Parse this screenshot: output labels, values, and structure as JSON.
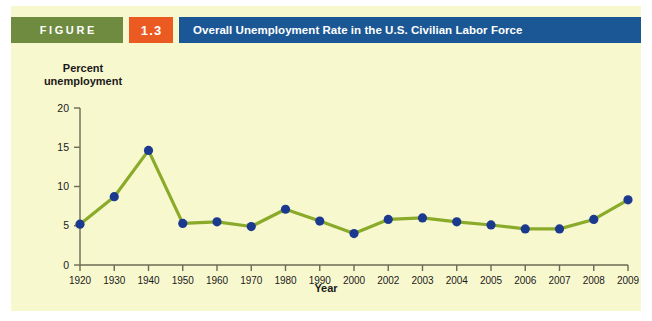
{
  "header": {
    "figure_label": "FIGURE",
    "figure_number": "1.3",
    "title": "Overall Unemployment Rate in the U.S. Civilian Labor Force",
    "figure_badge_color": "#6f8b3f",
    "number_badge_color": "#ea5a21",
    "title_bar_color": "#1b5795"
  },
  "panel": {
    "background_color": "#f8f8cf"
  },
  "chart_data": {
    "type": "line",
    "title": "Overall Unemployment Rate in the U.S. Civilian Labor Force",
    "xlabel": "Year",
    "ylabel": "Percent\nunemployment",
    "categories": [
      "1920",
      "1930",
      "1940",
      "1950",
      "1960",
      "1970",
      "1980",
      "1990",
      "2000",
      "2002",
      "2003",
      "2004",
      "2005",
      "2006",
      "2007",
      "2008",
      "2009"
    ],
    "values": [
      5.2,
      8.7,
      14.6,
      5.3,
      5.5,
      4.9,
      7.1,
      5.6,
      4.0,
      5.8,
      6.0,
      5.5,
      5.1,
      4.6,
      4.6,
      5.8,
      8.3
    ],
    "ylim": [
      0,
      20
    ],
    "yticks": [
      0,
      5,
      10,
      15,
      20
    ],
    "ytick_labels": [
      "0",
      "5",
      "10",
      "15",
      "20"
    ],
    "grid": false,
    "legend": false,
    "line_color": "#8aaa2a",
    "marker_color": "#1b3a8f",
    "axis_color": "#6b6b55",
    "series_name": "Percent unemployment"
  }
}
